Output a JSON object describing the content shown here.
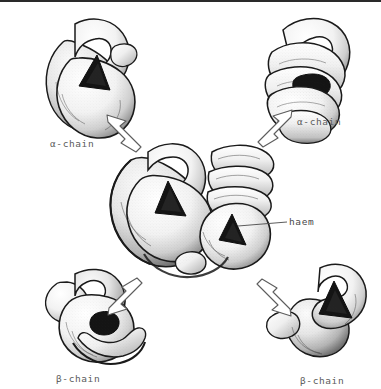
{
  "figure": {
    "background_color": "#ffffff",
    "ink_color": "#1a1a1a",
    "label_color": "#5c5c5c",
    "width": 381,
    "height": 389
  },
  "labels": {
    "alpha_top_left": "α-chain",
    "alpha_top_right": "α-chain",
    "beta_bottom_left": "β-chain",
    "beta_bottom_right": "β-chain",
    "haem": "haem"
  },
  "subunits": [
    {
      "id": "central-tetramer",
      "name": "haemoglobin-tetramer",
      "label": "",
      "position": "center"
    },
    {
      "id": "alpha-1",
      "name": "alpha-chain-subunit",
      "label": "α-chain",
      "position": "top-left"
    },
    {
      "id": "alpha-2",
      "name": "alpha-chain-subunit",
      "label": "α-chain",
      "position": "top-right"
    },
    {
      "id": "beta-1",
      "name": "beta-chain-subunit",
      "label": "β-chain",
      "position": "bottom-left"
    },
    {
      "id": "beta-2",
      "name": "beta-chain-subunit",
      "label": "β-chain",
      "position": "bottom-right"
    }
  ],
  "arrows": [
    {
      "id": "arrow-to-alpha-top-left",
      "direction": "up-left",
      "style": "hollow-outline"
    },
    {
      "id": "arrow-to-alpha-top-right",
      "direction": "up-right",
      "style": "hollow-outline"
    },
    {
      "id": "arrow-to-beta-bottom-left",
      "direction": "down-left",
      "style": "hollow-outline"
    },
    {
      "id": "arrow-to-beta-bottom-right",
      "direction": "down-right",
      "style": "hollow-outline"
    }
  ],
  "leader_lines": [
    {
      "id": "haem-leader",
      "from": "central-tetramer-haem-pocket",
      "to": "haem-label"
    }
  ]
}
